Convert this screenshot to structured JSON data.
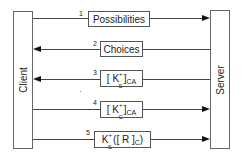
{
  "diagram": {
    "type": "sequence",
    "entities": {
      "client": {
        "label": "Client"
      },
      "server": {
        "label": "Server"
      }
    },
    "messages": [
      {
        "number": "1",
        "direction": "client-to-server",
        "label": "Possibilities"
      },
      {
        "number": "2",
        "direction": "server-to-client",
        "label": "Choices"
      },
      {
        "number": "3",
        "direction": "server-to-client",
        "label": "[ K_S^+ ]_CA",
        "parts": {
          "open": "[ K",
          "sup": "+",
          "sub": "S",
          "close": " ]",
          "tail_sub": "CA"
        }
      },
      {
        "number": "4",
        "direction": "client-to-server",
        "label": "[ K_C^+ ]_CA",
        "parts": {
          "open": "[ K",
          "sup": "+",
          "sub": "C",
          "close": " ]",
          "tail_sub": "CA"
        }
      },
      {
        "number": "5",
        "direction": "client-to-server",
        "label": "K_S^+([ R ]_C)",
        "parts": {
          "open": "K",
          "sup": "+",
          "sub": "S",
          "close": "([ R ]",
          "tail_sub": "C",
          "end": ")"
        }
      }
    ]
  }
}
